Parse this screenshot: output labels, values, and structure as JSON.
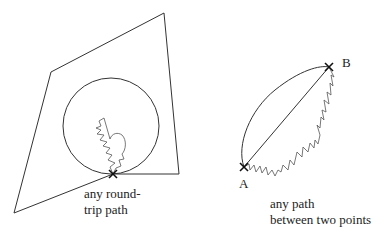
{
  "figure": {
    "left_diagram": {
      "caption_line1": "any round-",
      "caption_line2": "trip path"
    },
    "right_diagram": {
      "point_a": "A",
      "point_b": "B",
      "caption_line1": "any path",
      "caption_line2": "between two points"
    },
    "colors": {
      "stroke": "#333333",
      "background": "#ffffff"
    }
  }
}
